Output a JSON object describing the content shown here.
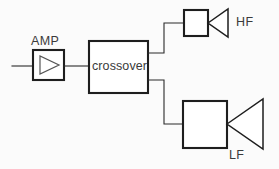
{
  "diagram": {
    "type": "block-diagram",
    "background_color": "#fbfbfb",
    "line_color": "#1e1e1e",
    "wire_color": "#2b2b2b",
    "labels": {
      "amp": "AMP",
      "crossover": "crossover",
      "hf": "HF",
      "lf": "LF"
    },
    "blocks": [
      {
        "id": "amp",
        "label": "AMP",
        "symbol": "amplifier-triangle",
        "x": 33,
        "y": 50,
        "width": 31,
        "height": 30
      },
      {
        "id": "crossover",
        "label": "crossover",
        "symbol": "rectangle",
        "x": 89,
        "y": 41,
        "width": 59,
        "height": 52
      },
      {
        "id": "hf",
        "label": "HF",
        "symbol": "speaker-box-cone",
        "x": 184,
        "y": 10,
        "width": 24,
        "height": 26
      },
      {
        "id": "lf",
        "label": "LF",
        "symbol": "speaker-box-cone",
        "x": 183,
        "y": 101,
        "width": 44,
        "height": 47
      }
    ],
    "connections": [
      {
        "from": "input",
        "to": "amp",
        "path": "straight"
      },
      {
        "from": "amp",
        "to": "crossover",
        "path": "straight"
      },
      {
        "from": "crossover",
        "to": "hf",
        "path": "stepped-up"
      },
      {
        "from": "crossover",
        "to": "lf",
        "path": "stepped-down"
      }
    ]
  }
}
